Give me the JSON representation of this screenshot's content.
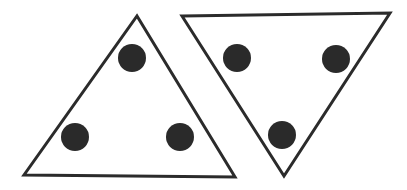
{
  "figure": {
    "background_color": "#ffffff",
    "width": 407,
    "height": 190,
    "stroke_color": "#2b2b2b",
    "stroke_width": 3,
    "dot_fill_color": "#2a2a2a",
    "dot_radius": 14,
    "shapes": [
      {
        "name": "upward-triangle",
        "orientation": "point-up",
        "points": "137,16 235,177 24,175",
        "dots": [
          {
            "name": "dot-top",
            "cx": 132,
            "cy": 58
          },
          {
            "name": "dot-bottom-left",
            "cx": 75,
            "cy": 137
          },
          {
            "name": "dot-bottom-right",
            "cx": 180,
            "cy": 137
          }
        ]
      },
      {
        "name": "downward-triangle",
        "orientation": "point-down",
        "points": "182,16 390,13 284,176",
        "dots": [
          {
            "name": "dot-top-left",
            "cx": 237,
            "cy": 58
          },
          {
            "name": "dot-top-right",
            "cx": 336,
            "cy": 59
          },
          {
            "name": "dot-bottom",
            "cx": 282,
            "cy": 135
          }
        ]
      }
    ],
    "counts": {
      "triangle_count": 2,
      "dots_per_triangle": 3,
      "total_dots": 6
    }
  }
}
